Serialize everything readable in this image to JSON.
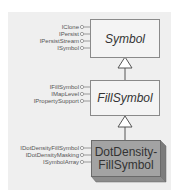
{
  "diagram": {
    "classes": [
      {
        "name": "Symbol",
        "type": "abstract",
        "interfaces": [
          "IClone",
          "IPersist",
          "IPersistStream",
          "ISymbol"
        ]
      },
      {
        "name": "FillSymbol",
        "type": "abstract",
        "interfaces": [
          "IFillSymbol",
          "IMapLevel",
          "IPropertySupport"
        ]
      },
      {
        "name_line1": "DotDensity-",
        "name_line2": "FillSymbol",
        "type": "concrete",
        "interfaces": [
          "IDotDensityFillSymbol",
          "IDotDensityMasking",
          "ISymbolArray"
        ]
      }
    ],
    "relationships": [
      {
        "from": "FillSymbol",
        "to": "Symbol",
        "kind": "inheritance"
      },
      {
        "from": "DotDensity-FillSymbol",
        "to": "FillSymbol",
        "kind": "inheritance"
      }
    ],
    "colors": {
      "panel": "#efefef",
      "abstract_fill": "#f4f4f4",
      "concrete_fill": "#a3a3a3",
      "concrete_side": "#7c7c7c",
      "line": "#555555"
    }
  }
}
